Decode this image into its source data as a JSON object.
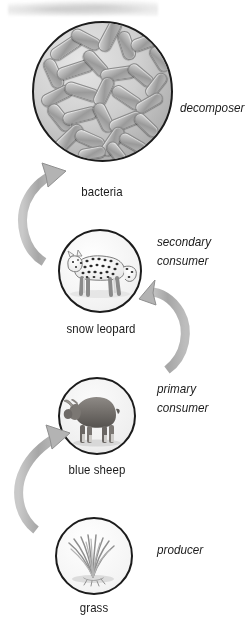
{
  "diagram": {
    "type": "cycle-diagram",
    "accent_color": "#b0b0b0",
    "outline_color": "#1c1c1c",
    "text_color": "#1b1b1b",
    "background": "#ffffff",
    "nodes": [
      {
        "id": "bacteria",
        "caption": "bacteria",
        "role": "decomposer",
        "role_lines": [
          "decomposer"
        ],
        "icon": "bacteria-icon",
        "order": 4
      },
      {
        "id": "snow-leopard",
        "caption": "snow leopard",
        "role": "secondary consumer",
        "role_lines": [
          "secondary",
          "consumer"
        ],
        "icon": "snow-leopard-icon",
        "order": 3
      },
      {
        "id": "blue-sheep",
        "caption": "blue sheep",
        "role": "primary consumer",
        "role_lines": [
          "primary",
          "consumer"
        ],
        "icon": "blue-sheep-icon",
        "order": 2
      },
      {
        "id": "grass",
        "caption": "grass",
        "role": "producer",
        "role_lines": [
          "producer"
        ],
        "icon": "grass-icon",
        "order": 1
      }
    ],
    "arrows": [
      {
        "id": "grass-to-sheep",
        "from": "grass",
        "to": "blue-sheep",
        "direction": "up"
      },
      {
        "id": "sheep-to-leopard",
        "from": "blue-sheep",
        "to": "snow-leopard",
        "direction": "up"
      },
      {
        "id": "leopard-to-bacteria",
        "from": "snow-leopard",
        "to": "bacteria",
        "direction": "up"
      }
    ]
  }
}
